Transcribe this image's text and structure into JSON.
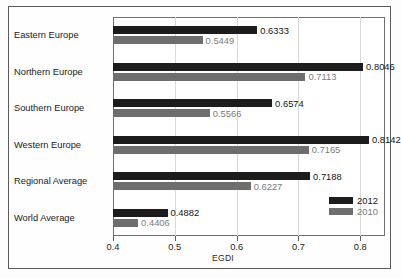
{
  "chart_data": {
    "type": "bar",
    "orientation": "horizontal",
    "title": "",
    "xlabel": "EGDI",
    "ylabel": "",
    "xlim": [
      0.4,
      0.84
    ],
    "xticks": [
      0.4,
      0.5,
      0.6,
      0.7,
      0.8
    ],
    "xtick_labels": [
      "0.4",
      "0.5",
      "0.6",
      "0.7",
      "0.8"
    ],
    "grid": true,
    "grid_axis": "x",
    "legend_position": "inside-bottom-right",
    "categories": [
      "Eastern Europe",
      "Northern Europe",
      "Southern Europe",
      "Western Europe",
      "Regional Average",
      "World Average"
    ],
    "series": [
      {
        "name": "2012",
        "color": "#1c1c1c",
        "values": [
          0.6333,
          0.8046,
          0.6574,
          0.8142,
          0.7188,
          0.4882
        ],
        "labels": [
          "0.6333",
          "0.8046",
          "0.6574",
          "0.8142",
          "0.7188",
          "0.4882"
        ]
      },
      {
        "name": "2010",
        "color": "#6e6e6e",
        "values": [
          0.5449,
          0.7113,
          0.5566,
          0.7165,
          0.6227,
          0.4406
        ],
        "labels": [
          "0.5449",
          "0.7113",
          "0.5566",
          "0.7165",
          "0.6227",
          "0.4406"
        ]
      }
    ],
    "legend": [
      {
        "label": "2012",
        "color": "#1c1c1c"
      },
      {
        "label": "2010",
        "color": "#6e6e6e"
      }
    ]
  }
}
